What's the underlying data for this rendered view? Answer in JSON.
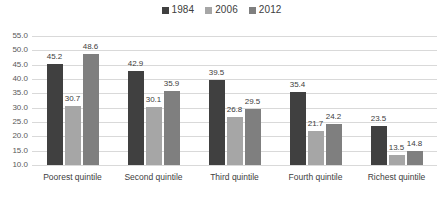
{
  "chart_data": {
    "type": "bar",
    "title": "",
    "subtitle": "",
    "xlabel": "",
    "ylabel": "",
    "ylim": [
      10.0,
      55.0
    ],
    "ytick_step": 5.0,
    "ytick_labels": [
      "55.0",
      "50.0",
      "45.0",
      "40.0",
      "35.0",
      "30.0",
      "25.0",
      "20.0",
      "15.0",
      "10.0"
    ],
    "ytick_values": [
      55.0,
      50.0,
      45.0,
      40.0,
      35.0,
      30.0,
      25.0,
      20.0,
      15.0,
      10.0
    ],
    "grid": true,
    "legend_position": "top-center",
    "categories": [
      "Poorest quintile",
      "Second quintile",
      "Third quintile",
      "Fourth quintile",
      "Richest quintile"
    ],
    "series": [
      {
        "name": "1984",
        "color": "#404040",
        "values": [
          45.2,
          42.9,
          39.5,
          35.4,
          23.5
        ],
        "labels": [
          "45.2",
          "42.9",
          "39.5",
          "35.4",
          "23.5"
        ]
      },
      {
        "name": "2006",
        "color": "#a6a6a6",
        "values": [
          30.7,
          30.1,
          26.8,
          21.7,
          13.5
        ],
        "labels": [
          "30.7",
          "30.1",
          "26.8",
          "21.7",
          "13.5"
        ]
      },
      {
        "name": "2012",
        "color": "#7f7f7f",
        "values": [
          48.6,
          35.9,
          29.5,
          24.2,
          14.8
        ],
        "labels": [
          "48.6",
          "35.9",
          "29.5",
          "24.2",
          "14.8"
        ]
      }
    ]
  },
  "colors": {
    "background": "#ffffff",
    "gridline": "#d9d9d9",
    "axis_text": "#595959",
    "label_text": "#404040"
  }
}
